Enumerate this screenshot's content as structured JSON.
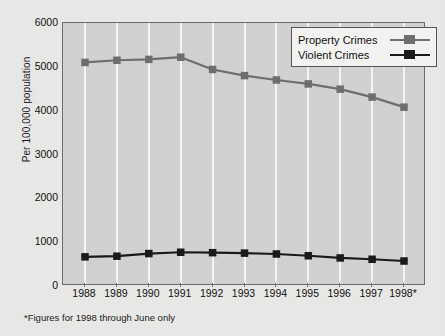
{
  "chart_data": {
    "type": "line",
    "title": "",
    "xlabel": "",
    "ylabel": "Per 100,000 population",
    "categories": [
      "1988",
      "1989",
      "1990",
      "1991",
      "1992",
      "1993",
      "1994",
      "1995",
      "1996",
      "1997",
      "1998*"
    ],
    "series": [
      {
        "name": "Property Crimes",
        "color": "#6e6e6e",
        "marker": "square",
        "values": [
          5100,
          5150,
          5170,
          5220,
          4940,
          4800,
          4700,
          4610,
          4490,
          4310,
          4080
        ]
      },
      {
        "name": "Violent Crimes",
        "color": "#1a1a1a",
        "marker": "square",
        "values": [
          665,
          680,
          740,
          770,
          760,
          750,
          730,
          690,
          640,
          610,
          570
        ]
      }
    ],
    "ylim": [
      0,
      6000
    ],
    "yticks": [
      0,
      1000,
      2000,
      3000,
      4000,
      5000,
      6000
    ],
    "ytick_labels": [
      "0",
      "1000",
      "2000",
      "3000",
      "4000",
      "5000",
      "6000"
    ],
    "grid": "vertical-only",
    "legend_position": "top-right"
  },
  "legend": {
    "entries": [
      {
        "label": "Property Crimes"
      },
      {
        "label": "Violent Crimes"
      }
    ]
  },
  "footnote": {
    "text": "*Figures for 1998 through June only"
  },
  "colors": {
    "background": "#eaeae8",
    "plot_background": "#d2d2d0",
    "gridline": "#f4f4f2",
    "axis": "#6d6d6d",
    "property_crimes": "#6e6e6e",
    "violent_crimes": "#1a1a1a"
  }
}
